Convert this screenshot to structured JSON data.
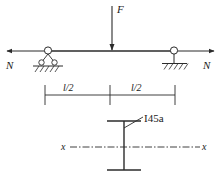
{
  "figure": {
    "stroke_color": "#2b2b2b",
    "background_color": "#ffffff"
  },
  "beam": {
    "load_label": "F",
    "axial_force_left_label": "N",
    "axial_force_right_label": "N",
    "left_support_type": "roller-support",
    "right_support_type": "pin-support"
  },
  "dimensions": {
    "left_span_label": "l/2",
    "right_span_label": "l/2"
  },
  "cross_section": {
    "designation_label": "I45a",
    "axis_label_left": "x",
    "axis_label_right": "x"
  }
}
